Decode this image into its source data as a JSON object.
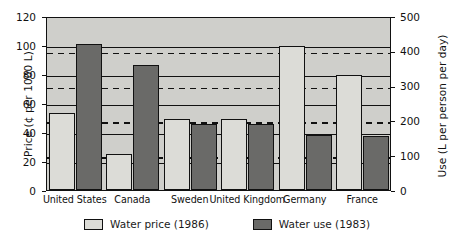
{
  "chart_data": {
    "type": "bar",
    "title": "",
    "categories": [
      "United States",
      "Canada",
      "Sweden",
      "United Kingdom",
      "Germany",
      "France"
    ],
    "series": [
      {
        "name": "Water price (1986)",
        "axis": "left",
        "unit": "cents per 1000 L",
        "color": "#dcdcd7",
        "values": [
          53,
          25,
          49,
          49,
          99,
          79
        ]
      },
      {
        "name": "Water use (1983)",
        "axis": "right",
        "unit": "L per person per day",
        "color": "#6a6a68",
        "values": [
          420,
          360,
          190,
          190,
          158,
          155
        ]
      }
    ],
    "left_axis": {
      "label": "Price (¢ per 1000 L)",
      "ylim": [
        0,
        120
      ],
      "ticks": [
        0,
        20,
        40,
        60,
        80,
        100,
        120
      ],
      "gridline_style": "solid"
    },
    "right_axis": {
      "label": "Use (L per person per day)",
      "ylim": [
        0,
        500
      ],
      "ticks": [
        0,
        100,
        200,
        300,
        400,
        500
      ],
      "gridline_style": "dashed"
    },
    "xlabel": "",
    "grid": true,
    "legend_position": "bottom"
  },
  "legend": {
    "price_label": "Water price (1986)",
    "use_label": "Water use (1983)"
  },
  "caption": ""
}
